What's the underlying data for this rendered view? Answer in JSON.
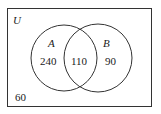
{
  "diagram": {
    "type": "venn",
    "universe_label": "U",
    "sets": [
      {
        "name": "A",
        "only_count": "240"
      },
      {
        "name": "B",
        "only_count": "90"
      }
    ],
    "intersection_count": "110",
    "outside_count": "60",
    "colors": {
      "stroke": "#333333",
      "text": "#1a1a1a",
      "background": "#ffffff"
    }
  }
}
